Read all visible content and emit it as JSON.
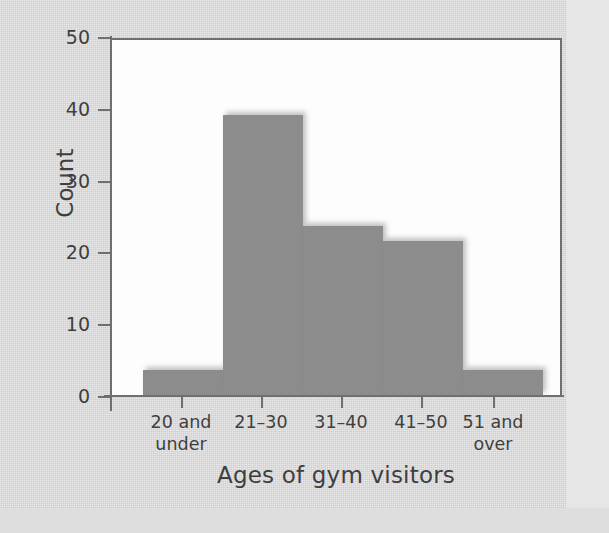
{
  "chart_data": {
    "type": "bar",
    "title": "",
    "xlabel": "Ages of gym visitors",
    "ylabel": "Count",
    "categories": [
      "20 and under",
      "21–30",
      "31–40",
      "41–50",
      "51 and over"
    ],
    "values": [
      3.5,
      39,
      23.5,
      21.5,
      3.5
    ],
    "ylim": [
      0,
      50
    ],
    "yticks": [
      0,
      10,
      20,
      30,
      40,
      50
    ],
    "ytick_labels": [
      "0",
      "10",
      "20",
      "30",
      "40",
      "50"
    ],
    "grid": false,
    "legend": null,
    "bar_color": "#8c8c8c",
    "axis_color": "#6f6f6f",
    "plot_background": "#fdfdfd",
    "page_background": "#d9d9d9"
  },
  "axes": {
    "y_title": "Count",
    "x_title": "Ages of gym visitors"
  },
  "x_labels": [
    {
      "line1": "20 and",
      "line2": "under"
    },
    {
      "line1": "21–30",
      "line2": ""
    },
    {
      "line1": "31–40",
      "line2": ""
    },
    {
      "line1": "41–50",
      "line2": ""
    },
    {
      "line1": "51 and",
      "line2": "over"
    }
  ],
  "y_labels": [
    "50",
    "40",
    "30",
    "20",
    "10",
    "0"
  ]
}
